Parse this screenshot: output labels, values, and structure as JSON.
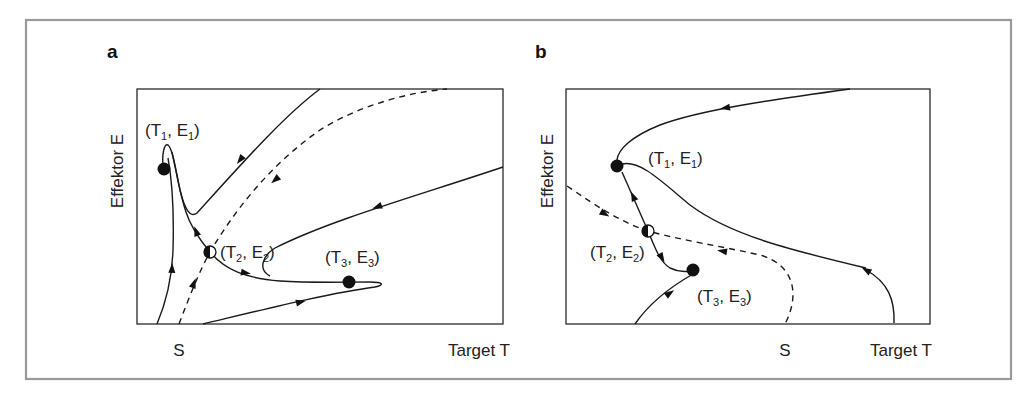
{
  "figure": {
    "panels": [
      {
        "letter": "a",
        "ylabel": "Effektor E",
        "xlabel": "Target T",
        "x_tick": "S",
        "points": [
          {
            "t": "T",
            "ti": "1",
            "e": "E",
            "ei": "1",
            "type": "stable"
          },
          {
            "t": "T",
            "ti": "2",
            "e": "E",
            "ei": "2",
            "type": "saddle"
          },
          {
            "t": "T",
            "ti": "3",
            "e": "E",
            "ei": "3",
            "type": "stable"
          }
        ]
      },
      {
        "letter": "b",
        "ylabel": "Effektor E",
        "xlabel": "Target T",
        "x_tick": "S",
        "points": [
          {
            "t": "T",
            "ti": "1",
            "e": "E",
            "ei": "1",
            "type": "stable"
          },
          {
            "t": "T",
            "ti": "2",
            "e": "E",
            "ei": "2",
            "type": "saddle"
          },
          {
            "t": "T",
            "ti": "3",
            "e": "E",
            "ei": "3",
            "type": "stable"
          }
        ]
      }
    ],
    "legend_semantics": {
      "filled_circle": "stable equilibrium",
      "half_filled_circle": "saddle point",
      "dashed_line": "separatrix",
      "solid_line": "trajectory"
    }
  }
}
